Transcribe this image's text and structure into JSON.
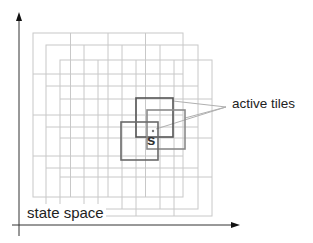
{
  "diagram": {
    "labels": {
      "active_tiles": "active tiles",
      "state_space": "state space",
      "state_point": "s"
    },
    "colors": {
      "grid_line": "#c8c8c8",
      "active_tile_dark": "#555555",
      "active_tile_mid": "#6a6a6a",
      "active_tile_light": "#8a8a8a",
      "axis": "#333333",
      "leader_line": "#b0b0b0"
    },
    "axes": {
      "y_axis": {
        "x": 19,
        "y_top": 12,
        "y_bottom": 236
      },
      "x_axis": {
        "y": 225,
        "x_left": 12,
        "x_right": 240
      }
    },
    "tilings": [
      {
        "name": "tiling-1",
        "x": 33,
        "y": 33,
        "cols": 4,
        "rows": 4,
        "cell_w": 37.5,
        "cell_h": 41
      },
      {
        "name": "tiling-2",
        "x": 46,
        "y": 45,
        "cols": 4,
        "rows": 4,
        "cell_w": 38,
        "cell_h": 41
      },
      {
        "name": "tiling-3",
        "x": 60,
        "y": 60,
        "cols": 4,
        "rows": 4,
        "cell_w": 38,
        "cell_h": 39
      }
    ],
    "active_tiles": [
      {
        "name": "active-tile-1",
        "x": 136,
        "y": 98,
        "w": 37,
        "h": 39
      },
      {
        "name": "active-tile-2",
        "x": 147,
        "y": 110,
        "w": 38,
        "h": 39
      },
      {
        "name": "active-tile-3",
        "x": 121,
        "y": 122,
        "w": 37,
        "h": 38
      }
    ],
    "state_point": {
      "x": 153,
      "y": 131
    }
  }
}
